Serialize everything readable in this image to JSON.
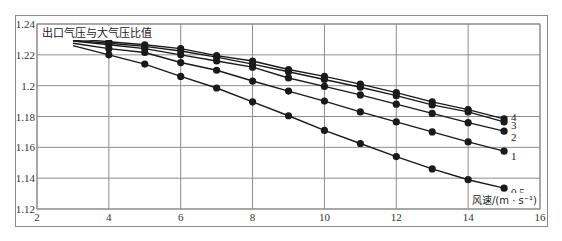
{
  "chart_data": {
    "type": "line",
    "title": "出口气压与大气压比值",
    "xlabel": "风速/(m·s⁻¹)",
    "ylabel": "出口气压与大气压比值",
    "xlim": [
      2,
      16
    ],
    "ylim": [
      1.12,
      1.24
    ],
    "xticks": [
      2,
      4,
      6,
      8,
      10,
      12,
      14,
      16
    ],
    "yticks": [
      "1.12",
      "1.14",
      "1.16",
      "1.18",
      "1.2",
      "1.22",
      "1.24"
    ],
    "grid": true,
    "legend_position": "inline-right",
    "x": [
      3,
      4,
      5,
      6,
      7,
      8,
      9,
      10,
      11,
      12,
      13,
      14,
      15
    ],
    "series": [
      {
        "name": "4",
        "line_start_no_marker": true,
        "values": [
          1.2305,
          1.2285,
          1.2265,
          1.224,
          1.2195,
          1.216,
          1.2105,
          1.206,
          1.201,
          1.1955,
          1.1895,
          1.1845,
          1.1785
        ]
      },
      {
        "name": "3",
        "line_start_no_marker": true,
        "values": [
          1.2295,
          1.2275,
          1.2255,
          1.2225,
          1.2185,
          1.214,
          1.209,
          1.204,
          1.199,
          1.1935,
          1.1875,
          1.183,
          1.1765
        ]
      },
      {
        "name": "2",
        "line_start_no_marker": true,
        "values": [
          1.229,
          1.2265,
          1.224,
          1.22,
          1.216,
          1.212,
          1.205,
          1.1995,
          1.194,
          1.188,
          1.182,
          1.176,
          1.1705
        ]
      },
      {
        "name": "1",
        "line_start_no_marker": true,
        "values": [
          1.2275,
          1.224,
          1.2215,
          1.215,
          1.21,
          1.203,
          1.1965,
          1.19,
          1.183,
          1.1765,
          1.17,
          1.1635,
          1.1575
        ]
      },
      {
        "name": "0.5",
        "line_start_no_marker": true,
        "values": [
          1.226,
          1.22,
          1.214,
          1.206,
          1.1985,
          1.1895,
          1.1805,
          1.171,
          1.1625,
          1.154,
          1.146,
          1.139,
          1.1335
        ]
      }
    ]
  },
  "labels": {
    "title": "出口气压与大气压比值",
    "xlabel": "风速/(m · s⁻¹)"
  },
  "colors": {
    "line": "#1a1a1a",
    "grid": "#8c8c8c",
    "frame": "#8c8c8c",
    "text": "#333333"
  }
}
